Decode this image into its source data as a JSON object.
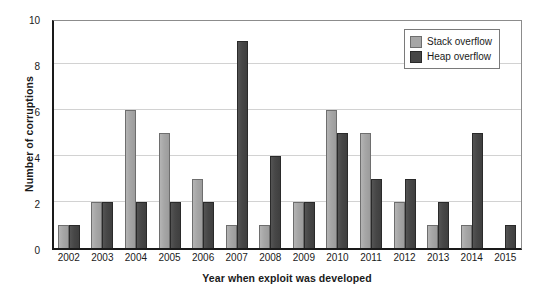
{
  "chart_data": {
    "type": "bar",
    "title": "",
    "xlabel": "Year when exploit was developed",
    "ylabel": "Number of corruptions",
    "categories": [
      "2002",
      "2003",
      "2004",
      "2005",
      "2006",
      "2007",
      "2008",
      "2009",
      "2010",
      "2011",
      "2012",
      "2013",
      "2014",
      "2015"
    ],
    "series": [
      {
        "name": "Stack overflow",
        "color": "#a6a6a6",
        "values": [
          1,
          2,
          6,
          5,
          3,
          1,
          1,
          2,
          6,
          5,
          2,
          1,
          1,
          0
        ]
      },
      {
        "name": "Heap overflow",
        "color": "#474747",
        "values": [
          1,
          2,
          2,
          2,
          2,
          9,
          4,
          2,
          5,
          3,
          3,
          2,
          5,
          1
        ]
      }
    ],
    "ylim": [
      0,
      10
    ],
    "yticks": [
      0,
      2,
      4,
      6,
      8,
      10
    ],
    "ytick_labels": [
      "0",
      "2",
      "4",
      "6",
      "8",
      "10"
    ],
    "grid": true,
    "grid_axis": "y",
    "legend_position": "top-right",
    "bar_group_mode": "grouped"
  },
  "axes": {
    "y_title": "Number of corruptions",
    "x_title": "Year when exploit was developed"
  },
  "legend": {
    "entries": [
      {
        "label": "Stack overflow",
        "swatch": "stack"
      },
      {
        "label": "Heap overflow",
        "swatch": "heap"
      }
    ]
  }
}
